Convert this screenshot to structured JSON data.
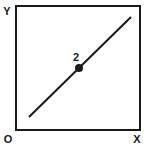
{
  "diagram": {
    "axes": {
      "y_label": "Y",
      "x_label": "X",
      "origin_label": "O"
    },
    "line": {
      "description": "straight diagonal line from lower-left to upper-right"
    },
    "point": {
      "label": "2"
    },
    "colors": {
      "stroke": "#1a1a1a",
      "background": "#ffffff"
    }
  }
}
